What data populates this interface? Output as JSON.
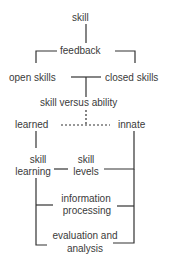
{
  "diagram": {
    "nodes": {
      "skill": "skill",
      "feedback": "feedback",
      "open_skills": "open skills",
      "closed_skills": "closed skills",
      "skill_versus_ability": "skill versus ability",
      "learned": "learned",
      "innate": "innate",
      "skill_learning_1": "skill",
      "skill_learning_2": "learning",
      "skill_levels_1": "skill",
      "skill_levels_2": "levels",
      "info_processing_1": "information",
      "info_processing_2": "processing",
      "evaluation_1": "evaluation and",
      "evaluation_2": "analysis"
    },
    "line_color": "#333333",
    "text_color": "#3a3a3a"
  }
}
